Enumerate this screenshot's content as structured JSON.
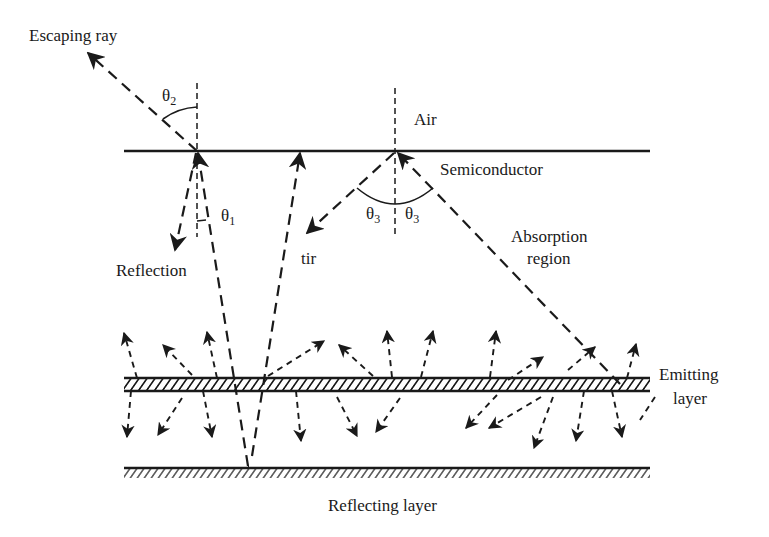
{
  "figure": {
    "labels": {
      "escaping_ray": "Escaping ray",
      "air": "Air",
      "semiconductor": "Semiconductor",
      "reflection": "Reflection",
      "tir": "tir",
      "absorption_region_line1": "Absorption",
      "absorption_region_line2": "region",
      "emitting_layer_line1": "Emitting",
      "emitting_layer_line2": "layer",
      "reflecting_layer": "Reflecting layer"
    },
    "angles": {
      "theta1": {
        "symbol": "θ",
        "subscript": "1"
      },
      "theta2": {
        "symbol": "θ",
        "subscript": "2"
      },
      "theta3_left": {
        "symbol": "θ",
        "subscript": "3"
      },
      "theta3_right": {
        "symbol": "θ",
        "subscript": "3"
      }
    },
    "colors": {
      "ink": "#1a1a1a",
      "background": "#ffffff"
    }
  }
}
